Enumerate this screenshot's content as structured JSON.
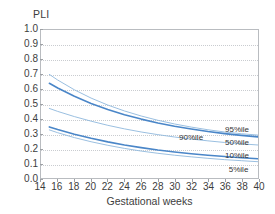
{
  "chart_data": {
    "type": "line",
    "title": "",
    "xlabel": "Gestational weeks",
    "ylabel": "PLI",
    "xlim": [
      14,
      40
    ],
    "ylim": [
      0.0,
      1.0
    ],
    "grid": true,
    "legend_position": "inline-right",
    "x_ticks": [
      14,
      16,
      18,
      20,
      22,
      24,
      26,
      28,
      30,
      32,
      34,
      36,
      38,
      40
    ],
    "y_ticks": [
      "0.0",
      "0.1",
      "0.2",
      "0.3",
      "0.4",
      "0.5",
      "0.6",
      "0.7",
      "0.8",
      "0.9",
      "1.0"
    ],
    "x": [
      15,
      16,
      18,
      20,
      22,
      24,
      26,
      28,
      30,
      32,
      34,
      36,
      38,
      40
    ],
    "series": [
      {
        "name": "95%ile",
        "label": "95%ile",
        "color": "#8fb8dd",
        "values": [
          0.7,
          0.662,
          0.596,
          0.54,
          0.493,
          0.453,
          0.419,
          0.39,
          0.365,
          0.344,
          0.326,
          0.311,
          0.299,
          0.29
        ]
      },
      {
        "name": "90%ile",
        "label": "90%ile",
        "color": "#4a86c8",
        "values": [
          0.64,
          0.608,
          0.552,
          0.504,
          0.463,
          0.428,
          0.398,
          0.372,
          0.35,
          0.331,
          0.314,
          0.3,
          0.288,
          0.278
        ]
      },
      {
        "name": "50%ile",
        "label": "50%ile",
        "color": "#8fb8dd",
        "values": [
          0.47,
          0.45,
          0.415,
          0.384,
          0.356,
          0.332,
          0.311,
          0.293,
          0.277,
          0.263,
          0.251,
          0.24,
          0.231,
          0.223
        ]
      },
      {
        "name": "10%ile",
        "label": "10%ile",
        "color": "#4a86c8",
        "values": [
          0.345,
          0.327,
          0.295,
          0.268,
          0.244,
          0.223,
          0.205,
          0.189,
          0.176,
          0.164,
          0.154,
          0.145,
          0.137,
          0.13
        ]
      },
      {
        "name": "5%ile",
        "label": "5%ile",
        "color": "#8fb8dd",
        "values": [
          0.325,
          0.306,
          0.273,
          0.245,
          0.221,
          0.2,
          0.182,
          0.167,
          0.154,
          0.143,
          0.133,
          0.124,
          0.117,
          0.11
        ]
      }
    ],
    "annotations": [
      {
        "text": "95%ile",
        "x_pct": 0.845,
        "y_value": 0.325
      },
      {
        "text": "90%ile",
        "x_pct": 0.635,
        "y_value": 0.272
      },
      {
        "text": "50%ile",
        "x_pct": 0.845,
        "y_value": 0.242
      },
      {
        "text": "10%ile",
        "x_pct": 0.845,
        "y_value": 0.152
      },
      {
        "text": "5%ile",
        "x_pct": 0.862,
        "y_value": 0.062
      }
    ],
    "colors": {
      "primary_line": "#4a86c8",
      "secondary_line": "#8fb8dd",
      "grid": "#c9ccd0",
      "frame": "#b9bcc0",
      "text": "#3d3d3d",
      "background": "#ffffff"
    }
  }
}
